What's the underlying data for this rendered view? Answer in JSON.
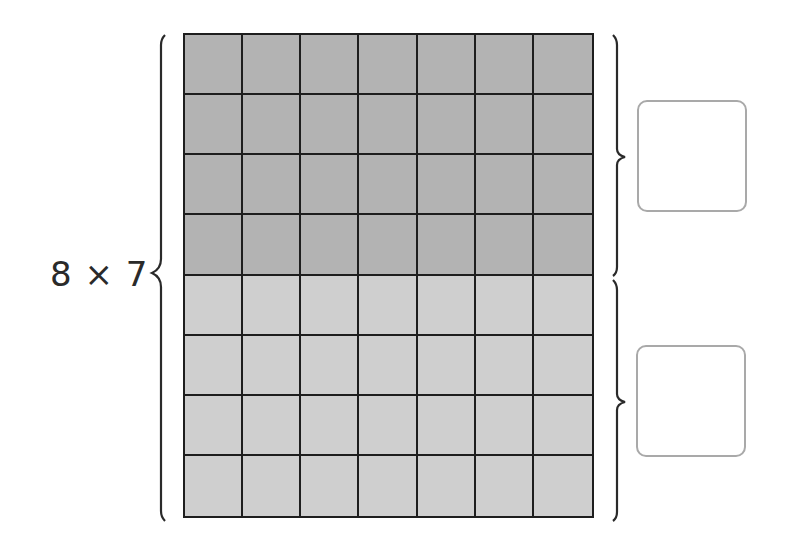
{
  "expression": "8 × 7",
  "grid": {
    "rows": 8,
    "columns": 7,
    "shaded_rows_dark": 4,
    "shaded_rows_light": 4,
    "dark_color": "#b3b3b3",
    "light_color": "#cfcfcf",
    "line_color": "#1e1e1e"
  },
  "answer_boxes": [
    {
      "label": "top-part",
      "value": ""
    },
    {
      "label": "bottom-part",
      "value": ""
    }
  ],
  "colors": {
    "box_border": "#a9a9a9",
    "text": "#2a2a2a"
  }
}
